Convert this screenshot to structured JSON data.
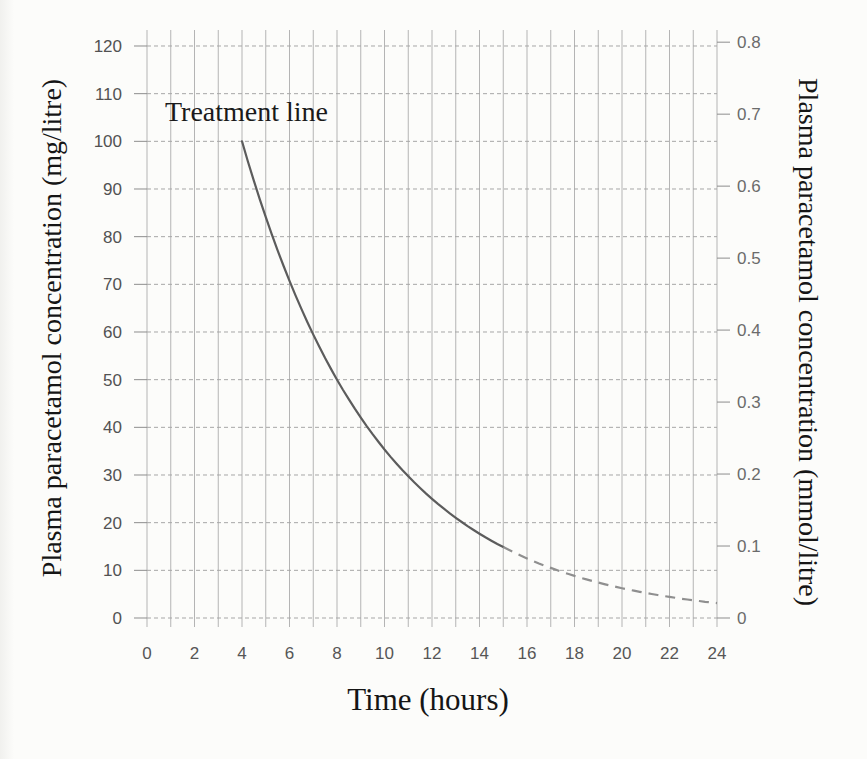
{
  "chart_data": {
    "type": "line",
    "title": "",
    "annotation": {
      "text": "Treatment line"
    },
    "x_axis": {
      "label": "Time (hours)",
      "min": 0,
      "max": 24,
      "tick_step": 2,
      "minor_grid_step_hours": 1,
      "ticks": [
        {
          "v": 0,
          "label": "0"
        },
        {
          "v": 2,
          "label": "2"
        },
        {
          "v": 4,
          "label": "4"
        },
        {
          "v": 6,
          "label": "6"
        },
        {
          "v": 8,
          "label": "8"
        },
        {
          "v": 10,
          "label": "10"
        },
        {
          "v": 12,
          "label": "12"
        },
        {
          "v": 14,
          "label": "14"
        },
        {
          "v": 16,
          "label": "16"
        },
        {
          "v": 18,
          "label": "18"
        },
        {
          "v": 20,
          "label": "20"
        },
        {
          "v": 22,
          "label": "22"
        },
        {
          "v": 24,
          "label": "24"
        }
      ]
    },
    "y_axis_left": {
      "label": "Plasma paracetamol concentration (mg/litre)",
      "min": 0,
      "max": 120,
      "tick_step": 10,
      "ticks": [
        {
          "v": 0,
          "label": "0"
        },
        {
          "v": 10,
          "label": "10"
        },
        {
          "v": 20,
          "label": "20"
        },
        {
          "v": 30,
          "label": "30"
        },
        {
          "v": 40,
          "label": "40"
        },
        {
          "v": 50,
          "label": "50"
        },
        {
          "v": 60,
          "label": "60"
        },
        {
          "v": 70,
          "label": "70"
        },
        {
          "v": 80,
          "label": "80"
        },
        {
          "v": 90,
          "label": "90"
        },
        {
          "v": 100,
          "label": "100"
        },
        {
          "v": 110,
          "label": "110"
        },
        {
          "v": 120,
          "label": "120"
        }
      ]
    },
    "y_axis_right": {
      "label": "Plasma paracetamol concentration (mmol/litre)",
      "min": 0,
      "max": 0.8,
      "tick_step": 0.1,
      "mg_per_mmol": 151,
      "ticks": [
        {
          "v": 0,
          "label": "0"
        },
        {
          "v": 0.1,
          "label": "0.1"
        },
        {
          "v": 0.2,
          "label": "0.2"
        },
        {
          "v": 0.3,
          "label": "0.3"
        },
        {
          "v": 0.4,
          "label": "0.4"
        },
        {
          "v": 0.5,
          "label": "0.5"
        },
        {
          "v": 0.6,
          "label": "0.6"
        },
        {
          "v": 0.7,
          "label": "0.7"
        },
        {
          "v": 0.8,
          "label": "0.8"
        }
      ]
    },
    "series": [
      {
        "name": "Treatment line",
        "model": {
          "type": "exponential_decay",
          "start_t_hours": 4,
          "start_mg_per_litre": 100,
          "half_life_hours": 4
        },
        "solid_range_hours": [
          4,
          15
        ],
        "dashed_range_hours": [
          15,
          24
        ],
        "points_t_hours": [
          4,
          5,
          6,
          7,
          8,
          9,
          10,
          11,
          12,
          13,
          14,
          15,
          16,
          17,
          18,
          19,
          20,
          21,
          22,
          23,
          24
        ],
        "points_mg_litre": [
          100,
          84.1,
          70.7,
          59.5,
          50,
          42,
          35.4,
          29.7,
          25,
          21,
          17.7,
          14.9,
          12.5,
          10.5,
          8.8,
          7.4,
          6.3,
          5.3,
          4.4,
          3.7,
          3.1
        ],
        "solid_color": "#5c5c5c",
        "dashed_color": "#8f8f8f"
      }
    ],
    "grid": {
      "on": true,
      "vertical_color": "#b4b4b4",
      "horizontal_color": "#a6a6a6",
      "horizontal_dashed": true,
      "tick_color": "#8d8d8d",
      "tick_label_color_left": "#525252",
      "tick_label_color_right": "#6b6b6b",
      "tick_label_color_x": "#565656"
    }
  }
}
